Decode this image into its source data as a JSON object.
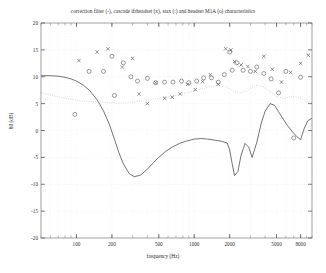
{
  "chart_data": {
    "type": "line",
    "title": "correction filter (-), cascade ifrheadset (x), stax (:) and headset M1A (o) characteristics",
    "xlabel": "frequency (Hz)",
    "ylabel": "80 (dB)",
    "xscale": "log",
    "xlim": [
      50,
      10000
    ],
    "ylim": [
      -20,
      20
    ],
    "grid": true,
    "legend_position": "none",
    "xticks": [
      100,
      200,
      500,
      1000,
      2000,
      5000,
      8000
    ],
    "xtick_labels": [
      "100",
      "200",
      "500",
      "1000",
      "2000",
      "5000",
      "8000"
    ],
    "yticks": [
      20,
      15,
      10,
      5,
      0,
      -5,
      -10,
      -15,
      -20
    ],
    "ytick_labels": [
      "20",
      "15",
      "10",
      "5",
      "0",
      "-5",
      "-10",
      "-15",
      "-20"
    ],
    "series": [
      {
        "name": "correction filter",
        "marker": "none",
        "linestyle": "solid",
        "color": "#444444",
        "x": [
          50,
          60,
          70,
          80,
          90,
          100,
          115,
          130,
          150,
          170,
          190,
          210,
          230,
          250,
          280,
          310,
          350,
          400,
          450,
          500,
          570,
          650,
          750,
          850,
          1000,
          1150,
          1300,
          1500,
          1700,
          1900,
          2000,
          2100,
          2200,
          2350,
          2500,
          2700,
          2900,
          3100,
          3400,
          3700,
          4000,
          4400,
          4800,
          5200,
          5700,
          6200,
          6800,
          7400,
          8000,
          8600,
          9200,
          10000
        ],
        "y": [
          10.2,
          10.2,
          10.1,
          9.9,
          9.6,
          9.2,
          8.4,
          7.4,
          5.7,
          3.6,
          1.2,
          -1.6,
          -4.2,
          -6.2,
          -8.0,
          -8.6,
          -8.3,
          -7.2,
          -6.0,
          -5.0,
          -3.9,
          -3.1,
          -2.4,
          -2.0,
          -1.6,
          -1.5,
          -1.6,
          -1.8,
          -2.0,
          -2.3,
          -3.6,
          -6.2,
          -8.4,
          -7.6,
          -4.6,
          -2.4,
          -3.1,
          -5.0,
          -2.2,
          1.3,
          3.6,
          5.0,
          4.7,
          3.5,
          2.1,
          0.9,
          -0.2,
          -1.1,
          -1.7,
          0.4,
          1.8,
          2.3
        ]
      },
      {
        "name": "stax",
        "marker": "none",
        "linestyle": "dotted",
        "color": "#b8b8b8",
        "x": [
          50,
          65,
          80,
          95,
          110,
          130,
          155,
          180,
          210,
          245,
          285,
          330,
          380,
          440,
          510,
          590,
          680,
          790,
          910,
          1050,
          1220,
          1400,
          1620,
          1870,
          2160,
          2490,
          2880,
          3320,
          3830,
          4420,
          5100,
          5880,
          6790,
          7830,
          9040,
          10000
        ],
        "y": [
          7.0,
          6.4,
          6.0,
          5.7,
          5.5,
          5.4,
          5.3,
          5.2,
          5.1,
          5.1,
          5.2,
          5.4,
          5.6,
          5.8,
          6.0,
          6.2,
          6.5,
          6.8,
          7.1,
          7.5,
          7.9,
          8.2,
          8.3,
          8.1,
          7.4,
          7.0,
          7.6,
          8.4,
          8.2,
          7.2,
          6.2,
          6.0,
          6.4,
          6.1,
          5.5,
          5.2
        ]
      },
      {
        "name": "cascade ifrheadset",
        "marker": "x",
        "linestyle": "none",
        "color": "#555555",
        "x": [
          105,
          150,
          185,
          245,
          300,
          340,
          400,
          470,
          560,
          650,
          760,
          880,
          1020,
          1180,
          1370,
          1600,
          1850,
          2050,
          2200,
          2500,
          2850,
          3300,
          3900,
          4600,
          5500,
          6600,
          8000,
          9300
        ],
        "y": [
          13.0,
          14.6,
          15.2,
          11.8,
          13.4,
          6.8,
          5.0,
          8.9,
          6.0,
          6.2,
          6.8,
          8.6,
          7.6,
          9.1,
          10.4,
          8.6,
          15.2,
          15.0,
          12.8,
          12.2,
          11.9,
          11.0,
          13.8,
          11.4,
          9.0,
          10.8,
          12.5,
          14.0
        ]
      },
      {
        "name": "headset M1A",
        "marker": "o",
        "linestyle": "none",
        "color": "#555555",
        "x": [
          97,
          128,
          170,
          200,
          210,
          250,
          290,
          330,
          400,
          470,
          560,
          660,
          780,
          900,
          1050,
          1200,
          1400,
          1600,
          1800,
          2000,
          2100,
          2300,
          2600,
          3000,
          3400,
          3900,
          4500,
          5200,
          6000,
          7000,
          8000
        ],
        "y": [
          3.0,
          11.0,
          11.0,
          13.8,
          6.5,
          12.6,
          10.0,
          9.2,
          9.7,
          8.9,
          9.0,
          9.0,
          9.2,
          8.9,
          9.2,
          9.8,
          9.8,
          9.0,
          10.4,
          14.6,
          11.2,
          12.6,
          11.2,
          11.0,
          11.8,
          10.6,
          9.6,
          7.0,
          11.0,
          -1.4,
          9.9
        ]
      }
    ]
  }
}
